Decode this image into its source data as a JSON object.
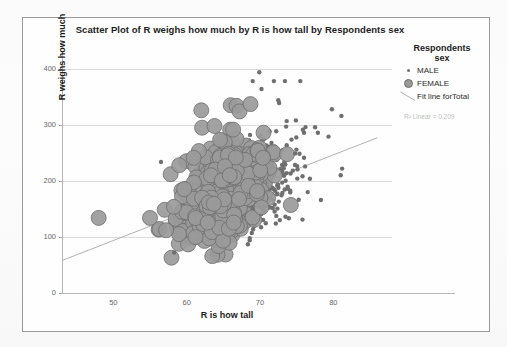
{
  "chart_data": {
    "type": "scatter",
    "title": "Scatter Plot of R weighs how much by R is how tall by Respondents sex",
    "xlabel": "R is how tall",
    "ylabel": "R weighs how much",
    "xlim": [
      43,
      88
    ],
    "ylim": [
      0,
      430
    ],
    "xticks": [
      50,
      60,
      70,
      80
    ],
    "yticks": [
      0,
      100,
      200,
      300,
      400
    ],
    "grid": true,
    "legend_position": "right",
    "legend_title": "Respondents\nsex",
    "annotation": "R² Linear = 0.209",
    "r_squared": 0.209,
    "fit_line": {
      "label": "Fit line forTotal",
      "x0": 43,
      "y0": 58,
      "x1": 86,
      "y1": 277
    },
    "series": [
      {
        "name": "MALE",
        "marker": "small-dot",
        "marker_size": 2.2,
        "color": "#6f6f6f",
        "count": 300,
        "x_mean": 70.3,
        "x_sd": 2.6,
        "y_mean": 195,
        "y_sd": 42
      },
      {
        "name": "FEMALE",
        "marker": "large-circle",
        "marker_size": 7.5,
        "color": "#9a9a9a",
        "edge_color": "#6e6e6e",
        "count": 520,
        "x_mean": 64.6,
        "x_sd": 2.7,
        "y_mean": 172,
        "y_sd": 41
      }
    ],
    "outliers": [
      {
        "series": "FEMALE",
        "x": 48.0,
        "y": 134
      },
      {
        "series": "FEMALE",
        "x": 55.0,
        "y": 134
      },
      {
        "series": "FEMALE",
        "x": 56.3,
        "y": 114
      },
      {
        "series": "FEMALE",
        "x": 57.2,
        "y": 112
      },
      {
        "series": "FEMALE",
        "x": 59.0,
        "y": 228
      },
      {
        "series": "FEMALE",
        "x": 62.0,
        "y": 326
      },
      {
        "series": "FEMALE",
        "x": 62.1,
        "y": 295
      },
      {
        "series": "FEMALE",
        "x": 63.8,
        "y": 298
      },
      {
        "series": "FEMALE",
        "x": 66.0,
        "y": 335
      },
      {
        "series": "FEMALE",
        "x": 66.8,
        "y": 334
      },
      {
        "series": "FEMALE",
        "x": 67.2,
        "y": 324
      },
      {
        "series": "FEMALE",
        "x": 68.7,
        "y": 337
      },
      {
        "series": "FEMALE",
        "x": 74.2,
        "y": 157
      },
      {
        "series": "MALE",
        "x": 56.5,
        "y": 234
      },
      {
        "series": "MALE",
        "x": 58.3,
        "y": 72
      },
      {
        "series": "MALE",
        "x": 69.9,
        "y": 394
      },
      {
        "series": "MALE",
        "x": 69.0,
        "y": 378
      },
      {
        "series": "MALE",
        "x": 70.2,
        "y": 364
      },
      {
        "series": "MALE",
        "x": 71.9,
        "y": 378
      },
      {
        "series": "MALE",
        "x": 73.4,
        "y": 378
      },
      {
        "series": "MALE",
        "x": 75.5,
        "y": 378
      },
      {
        "series": "MALE",
        "x": 72.5,
        "y": 344
      },
      {
        "series": "MALE",
        "x": 72.6,
        "y": 339
      },
      {
        "series": "MALE",
        "x": 74.9,
        "y": 308
      },
      {
        "series": "MALE",
        "x": 76.2,
        "y": 296
      },
      {
        "series": "MALE",
        "x": 79.8,
        "y": 328
      },
      {
        "series": "MALE",
        "x": 81.1,
        "y": 316
      },
      {
        "series": "MALE",
        "x": 77.9,
        "y": 286
      },
      {
        "series": "MALE",
        "x": 76.0,
        "y": 286
      },
      {
        "series": "MALE",
        "x": 74.8,
        "y": 249
      },
      {
        "series": "MALE",
        "x": 81.2,
        "y": 222
      },
      {
        "series": "MALE",
        "x": 81.0,
        "y": 210
      },
      {
        "series": "MALE",
        "x": 78.3,
        "y": 166
      },
      {
        "series": "MALE",
        "x": 76.5,
        "y": 180
      },
      {
        "series": "MALE",
        "x": 75.8,
        "y": 131
      },
      {
        "series": "MALE",
        "x": 72.7,
        "y": 130
      },
      {
        "series": "MALE",
        "x": 68.6,
        "y": 98
      },
      {
        "series": "MALE",
        "x": 68.6,
        "y": 94
      }
    ]
  },
  "chart": {
    "title": "Scatter Plot of R weighs how much by R is how tall by Respondents sex",
    "x_axis_title": "R is how tall",
    "y_axis_title": "R weighs how much",
    "x_tick_labels": [
      "50",
      "60",
      "70",
      "80"
    ],
    "y_tick_labels": [
      "400",
      "300",
      "200",
      "100",
      "0"
    ],
    "annotation": "R² Linear = 0.209"
  },
  "legend": {
    "title_line1": "Respondents",
    "title_line2": "sex",
    "items": [
      {
        "label": "MALE",
        "marker": "small-dot"
      },
      {
        "label": "FEMALE",
        "marker": "large-circle"
      },
      {
        "label": "Fit line forTotal",
        "marker": "fit-line"
      }
    ]
  },
  "colors": {
    "male_marker": "#6f6f6f",
    "female_fill": "#9a9a9a",
    "female_edge": "#6e6e6e",
    "fit_line": "#a9a9a9",
    "gridline": "#dcdcdc",
    "frame": "#9a9a9a",
    "text": "#1d1d1d",
    "tick_text": "#6a6a6a",
    "annotation_text": "#c0c0c0"
  }
}
